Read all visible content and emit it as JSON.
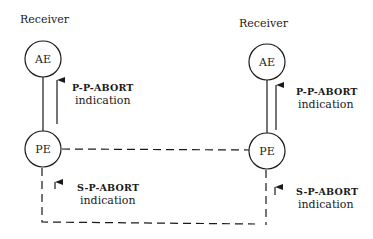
{
  "diagram": {
    "left": {
      "role_label": "Receiver",
      "upper_node": "AE",
      "lower_node": "PE",
      "upper_primitive": "P-P-ABORT",
      "upper_primitive_sub": "indication",
      "lower_primitive": "S-P-ABORT",
      "lower_primitive_sub": "indication"
    },
    "right": {
      "role_label": "Receiver",
      "upper_node": "AE",
      "lower_node": "PE",
      "upper_primitive": "P-P-ABORT",
      "upper_primitive_sub": "indication",
      "lower_primitive": "S-P-ABORT",
      "lower_primitive_sub": "indication"
    },
    "colors": {
      "stroke": "#1a1a1a",
      "background": "#ffffff"
    }
  }
}
